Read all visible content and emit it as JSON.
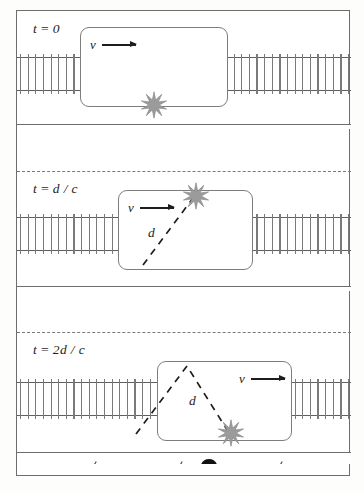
{
  "figure": {
    "panels": [
      {
        "id": "panel-t0",
        "time_label": "t = 0",
        "time_label_parts": {
          "t": "t",
          "eq": "=",
          "value": "0"
        },
        "velocity_label": "v",
        "distance_label": "",
        "flash_position": "floor-center",
        "light_path": "none",
        "car_offset_px": 63,
        "description": "Flash emitted at the floor of the train car"
      },
      {
        "id": "panel-tdc",
        "time_label": "t = d / c",
        "time_label_parts": {
          "t": "t",
          "eq": "=",
          "value": "d / c"
        },
        "velocity_label": "v",
        "distance_label": "d",
        "flash_position": "ceiling-right",
        "light_path": "diagonal-up",
        "car_offset_px": 101,
        "description": "Light has travelled distance d to the ceiling"
      },
      {
        "id": "panel-2dc",
        "time_label": "t = 2d / c",
        "time_label_parts": {
          "t": "t",
          "eq": "=",
          "value": "2d / c"
        },
        "velocity_label": "v",
        "distance_label": "d",
        "flash_position": "floor-right",
        "light_path": "inverted-v",
        "car_offset_px": 140,
        "description": "Light has returned to the floor, total path 2d"
      }
    ],
    "track": {
      "name": "railroad-track",
      "tie_count": 44,
      "rail_color": "#5f5f5f",
      "tie_color": "#7a7a7a"
    },
    "observer": {
      "name": "ground-observer",
      "hat_color": "#121212",
      "body_color": "#8e8e8e"
    },
    "flash": {
      "name": "light-flash-starburst",
      "color": "#9b9b9b",
      "points": 10
    },
    "grass": {
      "name": "grass-tuft",
      "color": "#4a4a4a",
      "count_per_strip": 6
    },
    "colors": {
      "frame": "#6d6d6d",
      "car_border": "#7d7d7d",
      "separator_solid": "#6e6e6e",
      "separator_dashed": "#7a7a7a",
      "light_path": "#1d1d1d",
      "text": "#1d1d1d",
      "background": "#ffffff"
    }
  }
}
